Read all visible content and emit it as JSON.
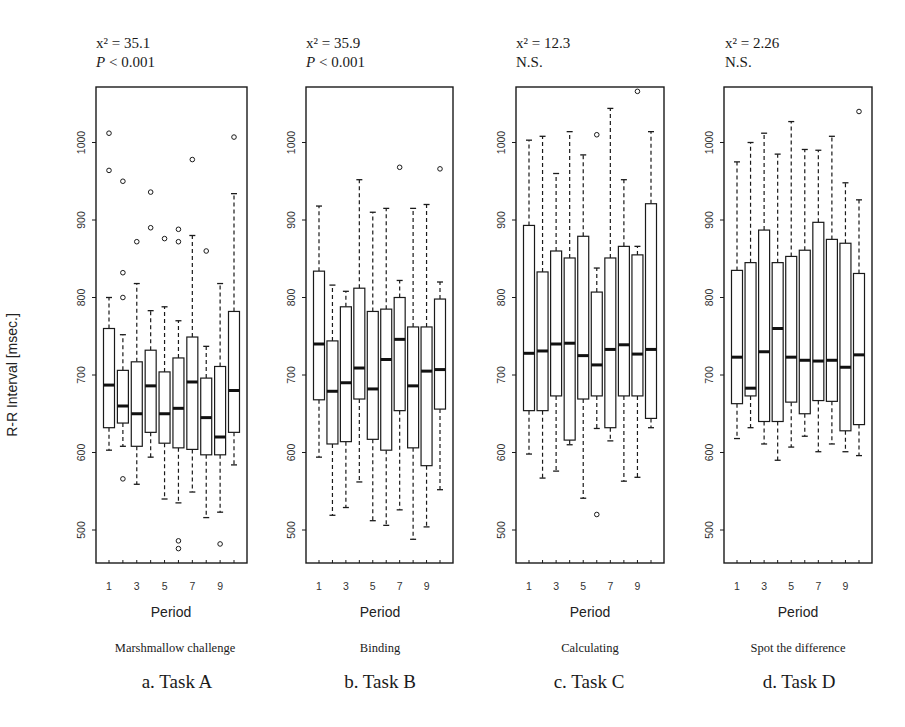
{
  "figure": {
    "ylabel": "R-R Interval [msec.]",
    "xlabel": "Period"
  },
  "chart_data": [
    {
      "type": "boxplot",
      "panel": "a",
      "title": "a. Task A",
      "task_name": "Marshmallow challenge",
      "stat_line1": "x² = 35.1",
      "stat_p_italic": "P",
      "stat_line2": " < 0.001",
      "xlabel": "Period",
      "ylabel": "R-R Interval [msec.]",
      "x_ticks": [
        1,
        3,
        5,
        7,
        9
      ],
      "y_ticks": [
        500,
        600,
        700,
        800,
        900,
        1000
      ],
      "ylim": [
        456,
        1072
      ],
      "grid": false,
      "categories": [
        1,
        2,
        3,
        4,
        5,
        6,
        7,
        8,
        9,
        10
      ],
      "boxes": [
        {
          "period": 1,
          "low": 603,
          "q1": 632,
          "median": 687,
          "q3": 760,
          "high": 800,
          "outliers": [
            1012,
            964
          ]
        },
        {
          "period": 2,
          "low": 608,
          "q1": 638,
          "median": 660,
          "q3": 706,
          "high": 752,
          "outliers": [
            950,
            832,
            800,
            566
          ]
        },
        {
          "period": 3,
          "low": 559,
          "q1": 608,
          "median": 650,
          "q3": 717,
          "high": 818,
          "outliers": [
            872
          ]
        },
        {
          "period": 4,
          "low": 594,
          "q1": 626,
          "median": 686,
          "q3": 732,
          "high": 783,
          "outliers": [
            936,
            890
          ]
        },
        {
          "period": 5,
          "low": 540,
          "q1": 612,
          "median": 650,
          "q3": 704,
          "high": 788,
          "outliers": [
            876
          ]
        },
        {
          "period": 6,
          "low": 535,
          "q1": 606,
          "median": 657,
          "q3": 722,
          "high": 770,
          "outliers": [
            888,
            872,
            486,
            476
          ]
        },
        {
          "period": 7,
          "low": 549,
          "q1": 604,
          "median": 691,
          "q3": 749,
          "high": 880,
          "outliers": [
            978
          ]
        },
        {
          "period": 8,
          "low": 516,
          "q1": 597,
          "median": 645,
          "q3": 696,
          "high": 737,
          "outliers": [
            860
          ]
        },
        {
          "period": 9,
          "low": 523,
          "q1": 597,
          "median": 620,
          "q3": 711,
          "high": 818,
          "outliers": [
            482
          ]
        },
        {
          "period": 10,
          "low": 584,
          "q1": 626,
          "median": 680,
          "q3": 782,
          "high": 934,
          "outliers": [
            1007
          ]
        }
      ]
    },
    {
      "type": "boxplot",
      "panel": "b",
      "title": "b. Task B",
      "task_name": "Binding",
      "stat_line1": "x² = 35.9",
      "stat_p_italic": "P",
      "stat_line2": " < 0.001",
      "xlabel": "Period",
      "ylabel": "",
      "x_ticks": [
        1,
        3,
        5,
        7,
        9
      ],
      "y_ticks": [
        500,
        600,
        700,
        800,
        900,
        1000
      ],
      "ylim": [
        456,
        1072
      ],
      "grid": false,
      "categories": [
        1,
        2,
        3,
        4,
        5,
        6,
        7,
        8,
        9,
        10
      ],
      "boxes": [
        {
          "period": 1,
          "low": 594,
          "q1": 668,
          "median": 740,
          "q3": 834,
          "high": 918,
          "outliers": []
        },
        {
          "period": 2,
          "low": 519,
          "q1": 611,
          "median": 679,
          "q3": 744,
          "high": 816,
          "outliers": []
        },
        {
          "period": 3,
          "low": 529,
          "q1": 614,
          "median": 690,
          "q3": 788,
          "high": 808,
          "outliers": []
        },
        {
          "period": 4,
          "low": 562,
          "q1": 669,
          "median": 709,
          "q3": 812,
          "high": 952,
          "outliers": []
        },
        {
          "period": 5,
          "low": 512,
          "q1": 617,
          "median": 682,
          "q3": 782,
          "high": 910,
          "outliers": []
        },
        {
          "period": 6,
          "low": 506,
          "q1": 603,
          "median": 720,
          "q3": 785,
          "high": 915,
          "outliers": []
        },
        {
          "period": 7,
          "low": 526,
          "q1": 654,
          "median": 746,
          "q3": 800,
          "high": 822,
          "outliers": [
            968
          ]
        },
        {
          "period": 8,
          "low": 488,
          "q1": 606,
          "median": 686,
          "q3": 762,
          "high": 915,
          "outliers": []
        },
        {
          "period": 9,
          "low": 504,
          "q1": 583,
          "median": 705,
          "q3": 762,
          "high": 920,
          "outliers": []
        },
        {
          "period": 10,
          "low": 552,
          "q1": 656,
          "median": 707,
          "q3": 798,
          "high": 820,
          "outliers": [
            966
          ]
        }
      ]
    },
    {
      "type": "boxplot",
      "panel": "c",
      "title": "c. Task C",
      "task_name": "Calculating",
      "stat_line1": "x² = 12.3",
      "stat_p_italic": "",
      "stat_line2": "N.S.",
      "xlabel": "Period",
      "ylabel": "",
      "x_ticks": [
        1,
        3,
        5,
        7,
        9
      ],
      "y_ticks": [
        500,
        600,
        700,
        800,
        900,
        1000
      ],
      "ylim": [
        456,
        1072
      ],
      "grid": false,
      "categories": [
        1,
        2,
        3,
        4,
        5,
        6,
        7,
        8,
        9,
        10
      ],
      "boxes": [
        {
          "period": 1,
          "low": 598,
          "q1": 654,
          "median": 728,
          "q3": 893,
          "high": 1003,
          "outliers": []
        },
        {
          "period": 2,
          "low": 567,
          "q1": 654,
          "median": 731,
          "q3": 833,
          "high": 1008,
          "outliers": []
        },
        {
          "period": 3,
          "low": 576,
          "q1": 673,
          "median": 740,
          "q3": 860,
          "high": 960,
          "outliers": []
        },
        {
          "period": 4,
          "low": 610,
          "q1": 616,
          "median": 741,
          "q3": 851,
          "high": 1014,
          "outliers": []
        },
        {
          "period": 5,
          "low": 541,
          "q1": 669,
          "median": 725,
          "q3": 879,
          "high": 984,
          "outliers": []
        },
        {
          "period": 6,
          "low": 631,
          "q1": 673,
          "median": 713,
          "q3": 807,
          "high": 838,
          "outliers": [
            1010,
            520
          ]
        },
        {
          "period": 7,
          "low": 615,
          "q1": 632,
          "median": 733,
          "q3": 851,
          "high": 1044,
          "outliers": []
        },
        {
          "period": 8,
          "low": 563,
          "q1": 673,
          "median": 739,
          "q3": 866,
          "high": 952,
          "outliers": []
        },
        {
          "period": 9,
          "low": 568,
          "q1": 673,
          "median": 727,
          "q3": 855,
          "high": 866,
          "outliers": [
            1066
          ]
        },
        {
          "period": 10,
          "low": 632,
          "q1": 644,
          "median": 733,
          "q3": 921,
          "high": 1014,
          "outliers": []
        }
      ]
    },
    {
      "type": "boxplot",
      "panel": "d",
      "title": "d. Task D",
      "task_name": "Spot the difference",
      "stat_line1": "x² = 2.26",
      "stat_p_italic": "",
      "stat_line2": "N.S.",
      "xlabel": "Period",
      "ylabel": "",
      "x_ticks": [
        1,
        3,
        5,
        7,
        9
      ],
      "y_ticks": [
        500,
        600,
        700,
        800,
        900,
        1000
      ],
      "ylim": [
        456,
        1072
      ],
      "grid": false,
      "categories": [
        1,
        2,
        3,
        4,
        5,
        6,
        7,
        8,
        9,
        10
      ],
      "boxes": [
        {
          "period": 1,
          "low": 618,
          "q1": 663,
          "median": 723,
          "q3": 835,
          "high": 975,
          "outliers": []
        },
        {
          "period": 2,
          "low": 632,
          "q1": 673,
          "median": 683,
          "q3": 845,
          "high": 1000,
          "outliers": []
        },
        {
          "period": 3,
          "low": 611,
          "q1": 640,
          "median": 730,
          "q3": 887,
          "high": 1012,
          "outliers": []
        },
        {
          "period": 4,
          "low": 590,
          "q1": 640,
          "median": 760,
          "q3": 845,
          "high": 985,
          "outliers": []
        },
        {
          "period": 5,
          "low": 607,
          "q1": 665,
          "median": 723,
          "q3": 853,
          "high": 1027,
          "outliers": []
        },
        {
          "period": 6,
          "low": 621,
          "q1": 650,
          "median": 719,
          "q3": 861,
          "high": 991,
          "outliers": []
        },
        {
          "period": 7,
          "low": 601,
          "q1": 667,
          "median": 718,
          "q3": 897,
          "high": 990,
          "outliers": []
        },
        {
          "period": 8,
          "low": 611,
          "q1": 666,
          "median": 719,
          "q3": 875,
          "high": 1008,
          "outliers": []
        },
        {
          "period": 9,
          "low": 601,
          "q1": 628,
          "median": 710,
          "q3": 870,
          "high": 948,
          "outliers": []
        },
        {
          "period": 10,
          "low": 596,
          "q1": 636,
          "median": 726,
          "q3": 831,
          "high": 926,
          "outliers": [
            1040
          ]
        }
      ]
    }
  ]
}
